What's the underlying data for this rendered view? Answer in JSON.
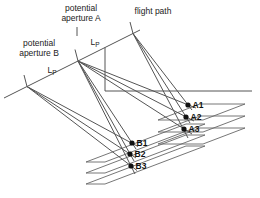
{
  "figure": {
    "canvas": {
      "width": 260,
      "height": 198,
      "background": "#ffffff"
    },
    "colors": {
      "line": "#555555",
      "plane": "#666666",
      "dot": "#111111",
      "text": "#222222"
    },
    "labels": {
      "aperture_a": {
        "line1": "potential",
        "line2": "aperture A",
        "x": 81,
        "y": 3
      },
      "flight_path": {
        "text": "flight path",
        "x": 153,
        "y": 6
      },
      "aperture_b": {
        "line1": "potential",
        "line2": "aperture B",
        "x": 39,
        "y": 38
      },
      "lp_a": {
        "main": "L",
        "sub": "P",
        "x": 95,
        "y": 37
      },
      "lp_b": {
        "main": "L",
        "sub": "P",
        "x": 52,
        "y": 65
      }
    },
    "points": [
      {
        "label": "A1",
        "x": 188,
        "y": 105
      },
      {
        "label": "A2",
        "x": 186,
        "y": 117
      },
      {
        "label": "A3",
        "x": 184,
        "y": 129
      },
      {
        "label": "B1",
        "x": 132,
        "y": 143
      },
      {
        "label": "B2",
        "x": 130,
        "y": 154
      },
      {
        "label": "B3",
        "x": 131,
        "y": 166
      }
    ],
    "segments": [
      {
        "name": "flight-path-line",
        "p": [
          4,
          98,
          140,
          30
        ]
      },
      {
        "name": "tick-aperture-b-left",
        "p": [
          27,
          86.5,
          24,
          75
        ]
      },
      {
        "name": "tick-aperture-mid",
        "p": [
          78,
          61,
          75,
          49.5
        ]
      },
      {
        "name": "tick-aperture-a-right",
        "p": [
          133,
          33.5,
          130,
          22
        ]
      },
      {
        "name": "leader-aperture-a",
        "p": [
          77,
          27,
          77,
          36
        ]
      },
      {
        "name": "vertical-reference",
        "p": [
          105,
          47.5,
          105,
          91
        ]
      },
      {
        "name": "horizontal-reference",
        "p": [
          105,
          91,
          252,
          91
        ]
      },
      {
        "name": "ray-bleft-b1",
        "p": [
          27,
          86.5,
          138,
          146.5
        ]
      },
      {
        "name": "ray-bleft-b2",
        "p": [
          27,
          86.5,
          136,
          158
        ]
      },
      {
        "name": "ray-bleft-b3",
        "p": [
          27,
          86.5,
          137,
          170.5
        ]
      },
      {
        "name": "ray-mid-b1",
        "p": [
          78,
          61,
          136,
          149
        ]
      },
      {
        "name": "ray-mid-b2",
        "p": [
          78,
          61,
          134,
          161
        ]
      },
      {
        "name": "ray-mid-b3",
        "p": [
          78,
          61,
          135,
          174
        ]
      },
      {
        "name": "ray-mid-a1",
        "p": [
          78,
          61,
          196,
          108
        ]
      },
      {
        "name": "ray-mid-a2",
        "p": [
          78,
          61,
          194,
          121
        ]
      },
      {
        "name": "ray-mid-a3",
        "p": [
          78,
          61,
          192,
          134
        ]
      },
      {
        "name": "ray-aright-a1",
        "p": [
          133,
          33.5,
          192,
          110
        ]
      },
      {
        "name": "ray-aright-a2",
        "p": [
          133,
          33.5,
          190,
          123
        ]
      },
      {
        "name": "ray-aright-a3",
        "p": [
          133,
          33.5,
          188,
          138
        ]
      }
    ],
    "planes": [
      {
        "name": "plane-b1",
        "pts": "86,162 105,162 205,124 186,124"
      },
      {
        "name": "plane-b2",
        "pts": "86,173 105,173 205,135 186,135"
      },
      {
        "name": "plane-b3",
        "pts": "86,184 105,184 205,146 186,146"
      },
      {
        "name": "plane-a1",
        "pts": "200,104 245,104 203,120 158,120"
      },
      {
        "name": "plane-a2",
        "pts": "200,116 245,116 203,132 158,132"
      },
      {
        "name": "plane-a3",
        "pts": "200,128 245,128 203,144 158,144"
      }
    ],
    "dot_radius": 2.6,
    "point_label_offset": {
      "dx": 4.5,
      "dy": -5.5
    }
  }
}
